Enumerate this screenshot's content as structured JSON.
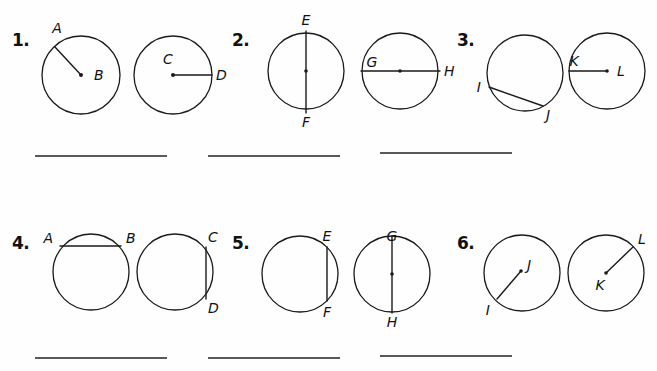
{
  "worksheet": {
    "background_color": "#fefefe",
    "ink_color": "#1a1a1a",
    "rule_color": "#555a5e"
  },
  "problems": [
    {
      "number": "1.",
      "figures": [
        {
          "labels": [
            "A",
            "B"
          ],
          "center_label": "B",
          "segment_kind": "radius",
          "endpoints_on_circle": [
            "A"
          ]
        },
        {
          "labels": [
            "C",
            "D"
          ],
          "center_label": "C",
          "segment_kind": "radius",
          "endpoints_on_circle": [
            "D"
          ]
        }
      ],
      "answer": ""
    },
    {
      "number": "2.",
      "figures": [
        {
          "labels": [
            "E",
            "F"
          ],
          "center_label": "",
          "segment_kind": "diameter",
          "endpoints_on_circle": [
            "E",
            "F"
          ]
        },
        {
          "labels": [
            "G",
            "H"
          ],
          "center_label": "",
          "segment_kind": "diameter",
          "endpoints_on_circle": [
            "G",
            "H"
          ]
        }
      ],
      "answer": ""
    },
    {
      "number": "3.",
      "figures": [
        {
          "labels": [
            "I",
            "J"
          ],
          "center_label": "",
          "segment_kind": "chord",
          "endpoints_on_circle": [
            "I",
            "J"
          ]
        },
        {
          "labels": [
            "K",
            "L"
          ],
          "center_label": "L",
          "segment_kind": "radius",
          "endpoints_on_circle": [
            "K"
          ]
        }
      ],
      "answer": ""
    },
    {
      "number": "4.",
      "figures": [
        {
          "labels": [
            "A",
            "B"
          ],
          "center_label": "",
          "segment_kind": "chord",
          "endpoints_on_circle": [
            "A",
            "B"
          ]
        },
        {
          "labels": [
            "C",
            "D"
          ],
          "center_label": "",
          "segment_kind": "chord",
          "endpoints_on_circle": [
            "C",
            "D"
          ]
        }
      ],
      "answer": ""
    },
    {
      "number": "5.",
      "figures": [
        {
          "labels": [
            "E",
            "F"
          ],
          "center_label": "",
          "segment_kind": "chord",
          "endpoints_on_circle": [
            "E",
            "F"
          ]
        },
        {
          "labels": [
            "G",
            "H"
          ],
          "center_label": "",
          "segment_kind": "diameter",
          "endpoints_on_circle": [
            "G",
            "H"
          ]
        }
      ],
      "answer": ""
    },
    {
      "number": "6.",
      "figures": [
        {
          "labels": [
            "I",
            "J"
          ],
          "center_label": "",
          "segment_kind": "segment",
          "endpoints_on_circle": [
            "I"
          ]
        },
        {
          "labels": [
            "K",
            "L"
          ],
          "center_label": "K",
          "segment_kind": "radius",
          "endpoints_on_circle": [
            "L"
          ]
        }
      ],
      "answer": ""
    }
  ]
}
